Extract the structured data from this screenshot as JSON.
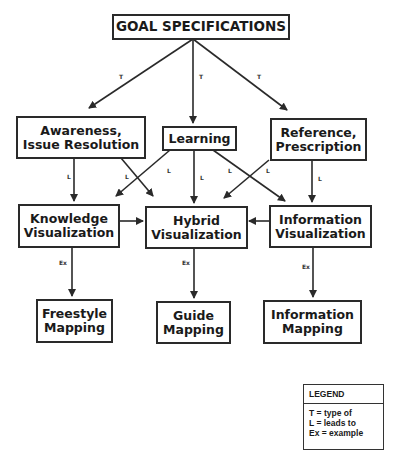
{
  "diagram": {
    "nodes": {
      "goal": "GOAL SPECIFICATIONS",
      "awareness": "Awareness,\nIssue Resolution",
      "learning": "Learning",
      "reference": "Reference,\nPrescription",
      "knowledge_vis": "Knowledge\nVisualization",
      "hybrid_vis": "Hybrid\nVisualization",
      "information_vis": "Information\nVisualization",
      "freestyle_mapping": "Freestyle\nMapping",
      "guide_mapping": "Guide\nMapping",
      "information_mapping": "Information\nMapping"
    },
    "edges": [
      {
        "from": "goal",
        "to": "awareness",
        "label": "T"
      },
      {
        "from": "goal",
        "to": "learning",
        "label": "T"
      },
      {
        "from": "goal",
        "to": "reference",
        "label": "T"
      },
      {
        "from": "awareness",
        "to": "knowledge_vis",
        "label": "L"
      },
      {
        "from": "awareness",
        "to": "hybrid_vis",
        "label": "L"
      },
      {
        "from": "learning",
        "to": "knowledge_vis",
        "label": "L"
      },
      {
        "from": "learning",
        "to": "hybrid_vis",
        "label": "L"
      },
      {
        "from": "learning",
        "to": "information_vis",
        "label": "L"
      },
      {
        "from": "reference",
        "to": "hybrid_vis",
        "label": "L"
      },
      {
        "from": "reference",
        "to": "information_vis",
        "label": "L"
      },
      {
        "from": "knowledge_vis",
        "to": "hybrid_vis",
        "label": ""
      },
      {
        "from": "information_vis",
        "to": "hybrid_vis",
        "label": ""
      },
      {
        "from": "knowledge_vis",
        "to": "freestyle_mapping",
        "label": "Ex"
      },
      {
        "from": "hybrid_vis",
        "to": "guide_mapping",
        "label": "Ex"
      },
      {
        "from": "information_vis",
        "to": "information_mapping",
        "label": "Ex"
      }
    ],
    "edge_labels": {
      "t": "T",
      "l": "L",
      "ex": "Ex"
    }
  },
  "legend": {
    "title": "LEGEND",
    "items": [
      "T = type of",
      "L = leads to",
      "Ex = example"
    ]
  },
  "colors": {
    "line": "#2a2a2a",
    "background": "#ffffff"
  }
}
